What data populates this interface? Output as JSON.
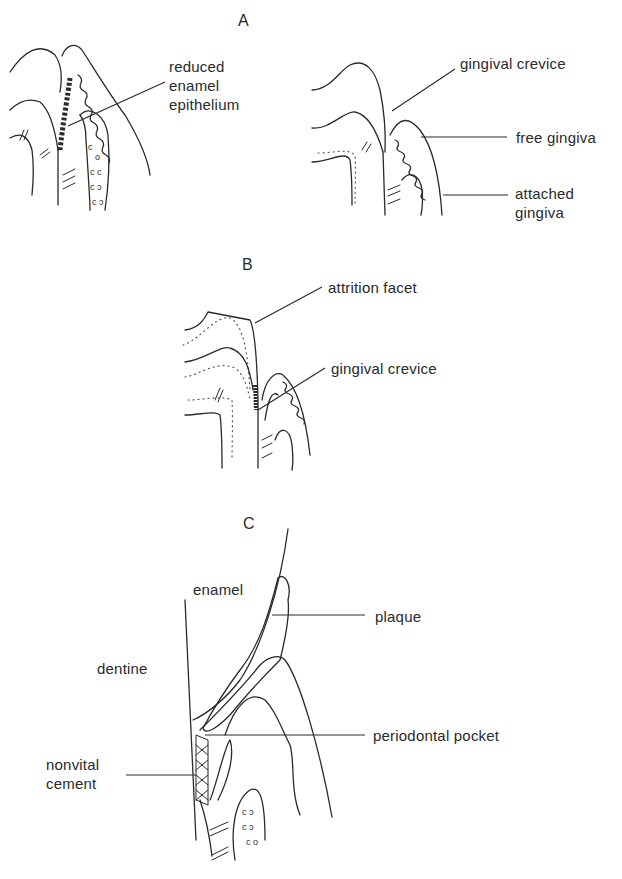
{
  "figure": {
    "panels": [
      {
        "id": "A",
        "letter": "A",
        "labels": {
          "reduced_enamel_epithelium": [
            "reduced",
            "enamel",
            "epithelium"
          ],
          "gingival_crevice": "gingival crevice",
          "free_gingiva": "free gingiva",
          "attached_gingiva": [
            "attached",
            "gingiva"
          ]
        }
      },
      {
        "id": "B",
        "letter": "B",
        "labels": {
          "attrition_facet": "attrition facet",
          "gingival_crevice": "gingival crevice"
        }
      },
      {
        "id": "C",
        "letter": "C",
        "labels": {
          "enamel": "enamel",
          "plaque": "plaque",
          "dentine": "dentine",
          "periodontal_pocket": "periodontal pocket",
          "nonvital_cement": [
            "nonvital",
            "cement"
          ]
        }
      }
    ]
  }
}
